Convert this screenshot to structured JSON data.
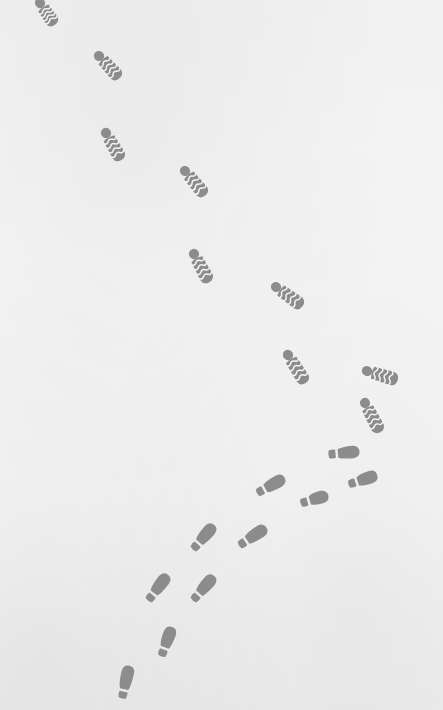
{
  "scene": {
    "description": "Two trails of footprints on a pale snow-like surface",
    "background_color": "#f4f4f4",
    "print_color": "#8c8c8c",
    "gap_color": "#f4f4f4"
  },
  "boot_prints": [
    {
      "heel": [
        40,
        3
      ],
      "toe": [
        51,
        19
      ]
    },
    {
      "heel": [
        99,
        56
      ],
      "toe": [
        115,
        73
      ]
    },
    {
      "heel": [
        106,
        133
      ],
      "toe": [
        118,
        154
      ]
    },
    {
      "heel": [
        185,
        171
      ],
      "toe": [
        201,
        190
      ]
    },
    {
      "heel": [
        194,
        254
      ],
      "toe": [
        206,
        276
      ]
    },
    {
      "heel": [
        276,
        287
      ],
      "toe": [
        297,
        302
      ]
    },
    {
      "heel": [
        288,
        355
      ],
      "toe": [
        302,
        377
      ]
    },
    {
      "heel": [
        367,
        371
      ],
      "toe": [
        391,
        378
      ]
    },
    {
      "heel": [
        365,
        403
      ],
      "toe": [
        377,
        426
      ]
    }
  ],
  "shoe_prints": [
    {
      "heel": [
        333,
        454
      ],
      "toe": [
        353,
        452
      ]
    },
    {
      "heel": [
        353,
        483
      ],
      "toe": [
        371,
        477
      ]
    },
    {
      "heel": [
        261,
        491
      ],
      "toe": [
        279,
        481
      ]
    },
    {
      "heel": [
        305,
        502
      ],
      "toe": [
        322,
        497
      ]
    },
    {
      "heel": [
        243,
        543
      ],
      "toe": [
        261,
        531
      ]
    },
    {
      "heel": [
        196,
        546
      ],
      "toe": [
        210,
        530
      ]
    },
    {
      "heel": [
        196,
        597
      ],
      "toe": [
        210,
        581
      ]
    },
    {
      "heel": [
        151,
        597
      ],
      "toe": [
        164,
        580
      ]
    },
    {
      "heel": [
        163,
        652
      ],
      "toe": [
        170,
        633
      ]
    },
    {
      "heel": [
        123,
        694
      ],
      "toe": [
        128,
        672
      ]
    }
  ]
}
